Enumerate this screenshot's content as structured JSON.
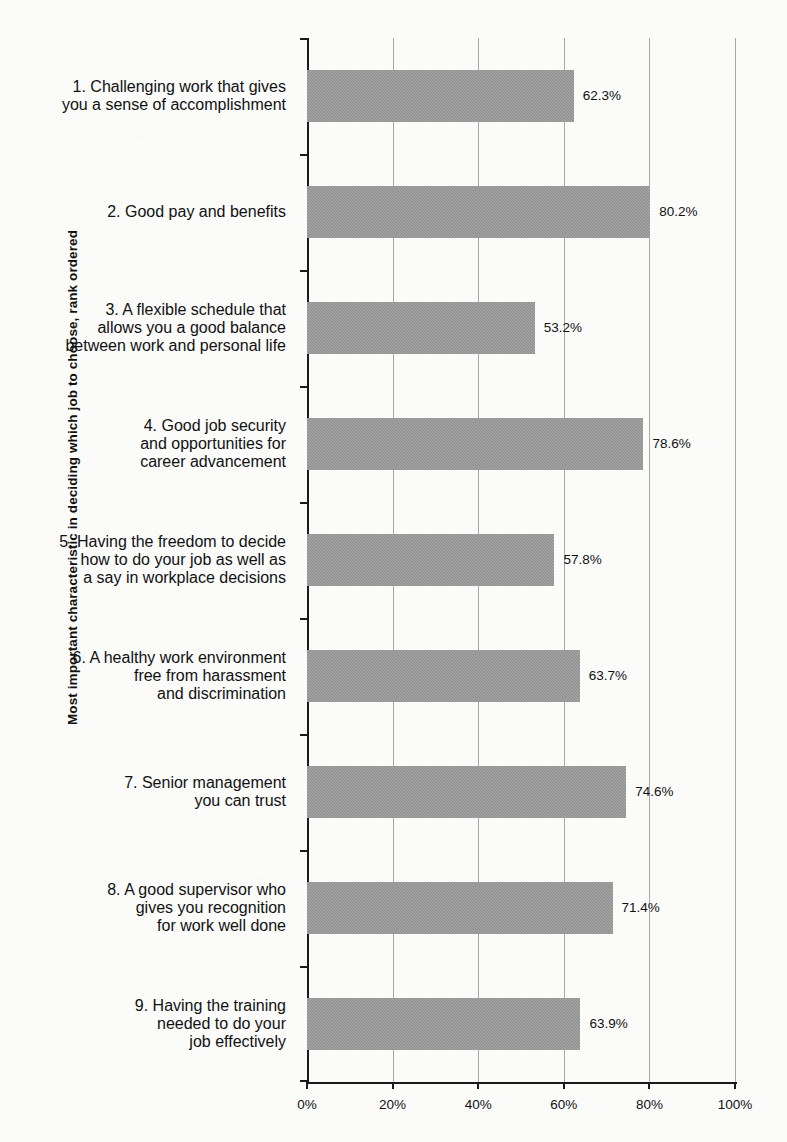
{
  "chart_data": {
    "type": "bar",
    "orientation": "horizontal",
    "title": "",
    "xlabel": "",
    "ylabel": "Most important characteristic in deciding which  job to choose, rank ordered",
    "xlim": [
      0,
      100
    ],
    "xticks": [
      "0%",
      "20%",
      "40%",
      "60%",
      "80%",
      "100%"
    ],
    "xtick_values": [
      0,
      20,
      40,
      60,
      80,
      100
    ],
    "grid": true,
    "grid_axis": "x",
    "legend": null,
    "bar_color": "#8b8b8b",
    "categories": [
      "1. Challenging work that gives you a sense of accomplishment",
      "2. Good pay and benefits",
      "3. A flexible schedule that allows you a good balance between work and personal life",
      "4. Good job security and opportunities for career advancement",
      "5. Having the freedom to decide how to do your job as well as a say in workplace decisions",
      "6. A healthy work environment free from harassment and discrimination",
      "7. Senior management you can trust",
      "8. A good supervisor who gives you recognition for work well done",
      "9. Having the training needed to do your job effectively"
    ],
    "category_lines": [
      [
        "1. Challenging work that gives",
        "you a sense of accomplishment"
      ],
      [
        "2. Good pay and benefits"
      ],
      [
        "3. A flexible schedule that",
        "allows you a good balance",
        "between work and personal life"
      ],
      [
        "4. Good job security",
        "and opportunities for",
        "career advancement"
      ],
      [
        "5. Having the freedom to decide",
        "how to do your job as well as",
        "a say in workplace decisions"
      ],
      [
        "6. A healthy work environment",
        "free from harassment",
        "and discrimination"
      ],
      [
        "7. Senior management",
        "you can trust"
      ],
      [
        "8. A good supervisor who",
        "gives you recognition",
        "for work well done"
      ],
      [
        "9. Having the training",
        "needed to do your",
        "job effectively"
      ]
    ],
    "values": [
      62.3,
      80.2,
      53.2,
      78.6,
      57.8,
      63.7,
      74.6,
      71.4,
      63.9
    ],
    "value_labels": [
      "62.3%",
      "80.2%",
      "53.2%",
      "78.6%",
      "57.8%",
      "63.7%",
      "74.6%",
      "71.4%",
      "63.9%"
    ]
  }
}
